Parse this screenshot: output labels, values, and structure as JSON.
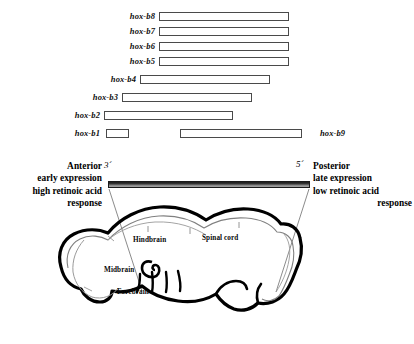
{
  "hox_map": {
    "genes": [
      {
        "name": "hox-b8",
        "label_side": "left",
        "label_x": 117,
        "label_w": 38,
        "bar_x": 159,
        "bar_w": 130,
        "y": 11
      },
      {
        "name": "hox-b7",
        "label_side": "left",
        "label_x": 117,
        "label_w": 38,
        "bar_x": 159,
        "bar_w": 130,
        "y": 26
      },
      {
        "name": "hox-b6",
        "label_side": "left",
        "label_x": 117,
        "label_w": 38,
        "bar_x": 159,
        "bar_w": 130,
        "y": 41
      },
      {
        "name": "hox-b5",
        "label_side": "left",
        "label_x": 117,
        "label_w": 38,
        "bar_x": 159,
        "bar_w": 130,
        "y": 56
      },
      {
        "name": "hox-b4",
        "label_side": "left",
        "label_x": 98,
        "label_w": 38,
        "bar_x": 140,
        "bar_w": 130,
        "y": 74
      },
      {
        "name": "hox-b3",
        "label_side": "left",
        "label_x": 80,
        "label_w": 38,
        "bar_x": 122,
        "bar_w": 130,
        "y": 92
      },
      {
        "name": "hox-b2",
        "label_side": "left",
        "label_x": 62,
        "label_w": 38,
        "bar_x": 104,
        "bar_w": 129,
        "y": 110
      },
      {
        "name": "hox-b1",
        "label_side": "left",
        "label_x": 62,
        "label_w": 38,
        "bar_x": 106,
        "bar_w": 23,
        "y": 128
      },
      {
        "name": "hox-b9",
        "label_side": "right",
        "label_x": 320,
        "label_w": 40,
        "bar_x": 180,
        "bar_w": 122,
        "y": 128
      }
    ]
  },
  "axis": {
    "three_prime": "3´",
    "five_prime": "5´",
    "gradient_note": "retinoic acid gradient bar"
  },
  "anterior": {
    "lines": [
      "Anterior",
      "early expression",
      "high retinoic acid"
    ],
    "last_line": "response"
  },
  "posterior": {
    "lines": [
      "Posterior",
      "late expression",
      "low retinoic acid"
    ],
    "last_line": "response"
  },
  "embryo": {
    "regions": [
      {
        "name": "Hindbrain",
        "x": 133,
        "y": 236
      },
      {
        "name": "Spinal cord",
        "x": 202,
        "y": 234
      },
      {
        "name": "Midbrain",
        "x": 104,
        "y": 266
      },
      {
        "name": "Forebrain",
        "x": 117,
        "y": 288
      }
    ]
  }
}
